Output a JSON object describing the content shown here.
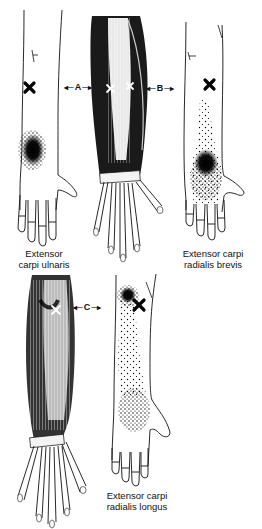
{
  "figure": {
    "panels": [
      {
        "id": "ecu",
        "caption_lines": [
          "Extensor",
          "carpi ulnaris"
        ],
        "trigger_marker": "x-mark",
        "referred_pain": "dense-ulnar-wrist"
      },
      {
        "id": "anatomy-top",
        "trigger_markers": [
          "x-mark",
          "x-mark"
        ],
        "view": "dorsal-forearm-muscles"
      },
      {
        "id": "ecrb",
        "caption_lines": [
          "Extensor carpi",
          "radialis brevis"
        ],
        "trigger_marker": "x-mark",
        "referred_pain": "dense-dorsal-wrist"
      },
      {
        "id": "anatomy-bottom",
        "trigger_markers": [
          "x-mark"
        ],
        "view": "dorsal-forearm-muscles"
      },
      {
        "id": "ecrl",
        "caption_lines": [
          "Extensor carpi",
          "radialis longus"
        ],
        "trigger_marker": "x-mark",
        "referred_pain": "lateral-epicondyle-and-hand"
      }
    ],
    "connectors": [
      {
        "label": "A"
      },
      {
        "label": "B"
      },
      {
        "label": "C"
      }
    ],
    "colors": {
      "ink": "#111111",
      "background": "#ffffff",
      "muscle_dark": "#1a1a1a"
    }
  }
}
